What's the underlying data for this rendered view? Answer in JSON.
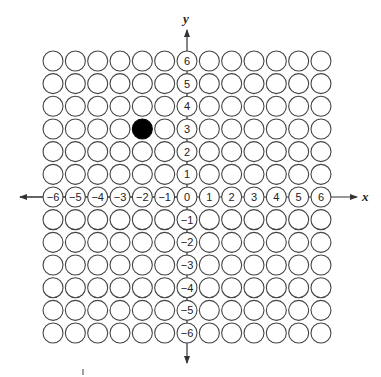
{
  "diagram": {
    "type": "coordinate-grid",
    "axes": {
      "x_label": "x",
      "y_label": "y",
      "x_range": [
        -6,
        6
      ],
      "y_range": [
        -6,
        6
      ]
    },
    "x_tick_labels": [
      "−6",
      "−5",
      "−4",
      "−3",
      "−2",
      "−1",
      "0",
      "1",
      "2",
      "3",
      "4",
      "5",
      "6"
    ],
    "y_tick_labels": [
      "6",
      "5",
      "4",
      "3",
      "2",
      "1",
      "0",
      "−1",
      "−2",
      "−3",
      "−4",
      "−5",
      "−6"
    ],
    "filled_points": [
      {
        "x": -2,
        "y": 3
      }
    ],
    "colors": {
      "circle_stroke": "#444444",
      "circle_fill": "#ffffff",
      "filled_point": "#000000",
      "axis": "#333333"
    }
  }
}
